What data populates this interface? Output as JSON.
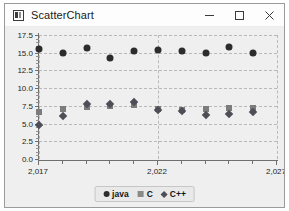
{
  "window": {
    "title": "ScatterChart",
    "icon": "app-icon",
    "controls": {
      "minimize": "minimize-button",
      "maximize": "maximize-button",
      "close": "close-button"
    }
  },
  "legend": {
    "position": "bottom-center",
    "items": [
      {
        "label": "java",
        "marker": "circle",
        "color": "#2c2c2c"
      },
      {
        "label": "C",
        "marker": "square",
        "color": "#8a8a8a"
      },
      {
        "label": "C++",
        "marker": "diamond",
        "color": "#4e4e57"
      }
    ]
  },
  "chart_data": {
    "type": "scatter",
    "title": "",
    "xlabel": "",
    "ylabel": "",
    "xlim": [
      2017,
      2027
    ],
    "ylim": [
      0.0,
      17.5
    ],
    "grid": true,
    "x_ticks": [
      2017,
      2022,
      2027
    ],
    "x_tick_labels": [
      "2,017",
      "2,022",
      "2,027"
    ],
    "x_minor_ticks": [
      2018,
      2019,
      2020,
      2021,
      2023,
      2024,
      2025,
      2026
    ],
    "y_ticks": [
      0.0,
      2.5,
      5.0,
      7.5,
      10.0,
      12.5,
      15.0,
      17.5
    ],
    "y_tick_labels": [
      "0.0",
      "2.5",
      "5.0",
      "7.5",
      "10.0",
      "12.5",
      "15.0",
      "17.5"
    ],
    "x": [
      2017,
      2018,
      2019,
      2020,
      2021,
      2022,
      2023,
      2024,
      2025,
      2026,
      2027
    ],
    "series": [
      {
        "name": "java",
        "marker": "circle",
        "color": "#2c2c2c",
        "x": [
          2017,
          2018,
          2019,
          2020,
          2021,
          2022,
          2023,
          2024,
          2025,
          2026
        ],
        "values": [
          15.5,
          15.0,
          15.7,
          14.3,
          15.2,
          15.4,
          15.2,
          15.0,
          15.8,
          15.0
        ]
      },
      {
        "name": "C",
        "marker": "square",
        "color": "#7c7c7c",
        "x": [
          2017,
          2018,
          2019,
          2020,
          2021,
          2022,
          2023,
          2024,
          2025,
          2026
        ],
        "values": [
          6.7,
          7.0,
          7.4,
          7.5,
          7.6,
          7.0,
          6.9,
          7.0,
          7.2,
          7.2
        ]
      },
      {
        "name": "C++",
        "marker": "diamond",
        "color": "#4e4e57",
        "x": [
          2017,
          2018,
          2019,
          2020,
          2021,
          2022,
          2023,
          2024,
          2025,
          2026
        ],
        "values": [
          4.8,
          6.1,
          7.7,
          7.8,
          8.0,
          6.9,
          6.8,
          6.2,
          6.4,
          6.6
        ]
      }
    ]
  }
}
